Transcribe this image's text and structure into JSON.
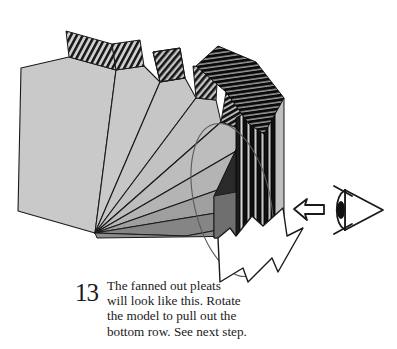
{
  "figure": {
    "step_number": "13",
    "caption": "The fanned out pleats will look like this. Rotate the model to pull out the bottom row. See next step.",
    "caption_lines": [
      "The fanned out pleats",
      "will look like this. Rotate",
      "the model to pull out the",
      "bottom row. See next step."
    ],
    "icons": {
      "eye_indicator": "eye-view-direction-icon",
      "view_arrow": "left-arrow-icon",
      "rotation_arrow": "curved-rotation-arrow-icon",
      "rotation_ellipse": "rotation-path-ellipse-icon"
    },
    "colors": {
      "background": "#ffffff",
      "panel_light": "#c9c9c9",
      "panel_mid": "#9a9a9a",
      "panel_dark": "#808080",
      "pleat_dark": "#1a1a1a",
      "outline": "#1a1a1a",
      "text": "#1a1a1a"
    },
    "geometry": {
      "apex_x": 95,
      "apex_y": 233,
      "wedge_count": 9,
      "pleat_stack_count": 24
    }
  }
}
